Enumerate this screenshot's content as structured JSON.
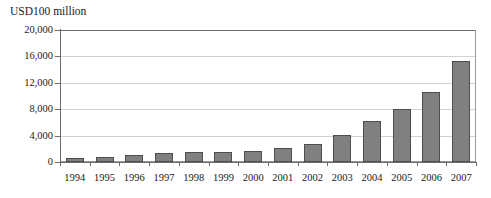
{
  "chart_data": {
    "type": "bar",
    "title": "",
    "ylabel": "USD100 million",
    "xlabel": "",
    "ylim": [
      0,
      20000
    ],
    "ytick_labels": [
      "0",
      "4,000",
      "8,000",
      "12,000",
      "16,000",
      "20,000"
    ],
    "ytick_values": [
      0,
      4000,
      8000,
      12000,
      16000,
      20000
    ],
    "grid": true,
    "legend": "none",
    "categories": [
      "1994",
      "1995",
      "1996",
      "1997",
      "1998",
      "1999",
      "2000",
      "2001",
      "2002",
      "2003",
      "2004",
      "2005",
      "2006",
      "2007"
    ],
    "values": [
      600,
      800,
      1100,
      1400,
      1500,
      1500,
      1600,
      2100,
      2800,
      4100,
      6200,
      8100,
      10600,
      15300
    ],
    "bar_color": "#808080",
    "bar_edge_color": "#4d4d4d",
    "gridline_color": "#d2d2d2",
    "axis_color": "#6b6b6b"
  }
}
